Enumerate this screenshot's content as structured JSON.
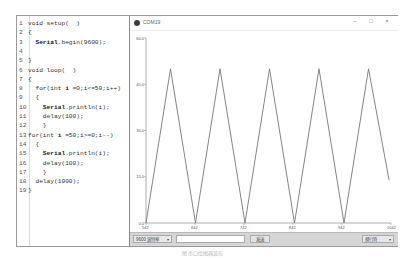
{
  "code_editor": {
    "lines": [
      {
        "n": "1",
        "text": "void setup(  )"
      },
      {
        "n": "2",
        "text": "{"
      },
      {
        "n": "3",
        "text": "  Serial.begin(9600);"
      },
      {
        "n": "4",
        "text": ""
      },
      {
        "n": "5",
        "text": "}"
      },
      {
        "n": "6",
        "text": "void loop(  )"
      },
      {
        "n": "7",
        "text": "{"
      },
      {
        "n": "8",
        "text": "  for(int i =0;i<=50;i++)"
      },
      {
        "n": "9",
        "text": "  {"
      },
      {
        "n": "10",
        "text": "    Serial.println(i);"
      },
      {
        "n": "11",
        "text": "    delay(100);"
      },
      {
        "n": "12",
        "text": "    }"
      },
      {
        "n": "13",
        "text": "for(int i =50;i>=0;i--)"
      },
      {
        "n": "14",
        "text": "  {"
      },
      {
        "n": "15",
        "text": "    Serial.println(i);"
      },
      {
        "n": "16",
        "text": "    delay(100);"
      },
      {
        "n": "17",
        "text": "    }"
      },
      {
        "n": "18",
        "text": "  delay(1000);"
      },
      {
        "n": "19",
        "text": "}"
      }
    ]
  },
  "plotter_window": {
    "title": "COM19",
    "controls": {
      "minimize": "–",
      "maximize": "□",
      "close": "×"
    },
    "baud_select": "9600 波特率",
    "send_input_value": "",
    "send_button": "发送",
    "line_ending_select": "换行符"
  },
  "chart_data": {
    "type": "line",
    "title": "",
    "xlabel": "",
    "ylabel": "",
    "ylim": [
      0,
      60
    ],
    "yticks": [
      "60.0",
      "45.0",
      "30.0",
      "15.0",
      "0.0"
    ],
    "xticks": [
      "542",
      "642",
      "742",
      "842",
      "942",
      "1042"
    ],
    "grid": false,
    "series": [
      {
        "name": "value",
        "color": "#777777",
        "points": [
          [
            542,
            0
          ],
          [
            592,
            50
          ],
          [
            643,
            0
          ],
          [
            693,
            50
          ],
          [
            744,
            0
          ],
          [
            794,
            50
          ],
          [
            845,
            0
          ],
          [
            895,
            50
          ],
          [
            946,
            0
          ],
          [
            996,
            50
          ],
          [
            1038,
            14
          ]
        ]
      }
    ]
  },
  "caption": "图    串口绘图器波形"
}
